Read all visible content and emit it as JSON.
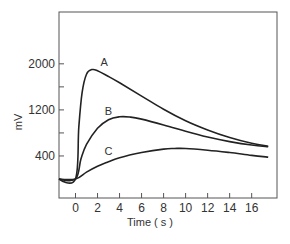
{
  "chart_data": {
    "type": "line",
    "title": "",
    "xlabel": "Time ( s )",
    "ylabel": "mV",
    "xlim": [
      -1.5,
      18.3
    ],
    "ylim": [
      -330,
      2900
    ],
    "grid": false,
    "legend": "inline curve labels",
    "x_ticks": [
      0,
      2,
      4,
      6,
      8,
      10,
      12,
      14,
      16
    ],
    "x_tick_labels": [
      "0",
      "2",
      "4",
      "6",
      "8",
      "10",
      "12",
      "14",
      "16"
    ],
    "y_ticks": [
      400,
      800,
      1200,
      1600,
      2000
    ],
    "y_tick_labels": [
      "400",
      "",
      "1200",
      "",
      "2000"
    ],
    "series": [
      {
        "name": "A",
        "x": [
          -1.5,
          0,
          0.3,
          0.6,
          1.0,
          1.5,
          2.0,
          3,
          4,
          6,
          8,
          10,
          12,
          14,
          16,
          17.5
        ],
        "values": [
          0,
          0,
          900,
          1500,
          1820,
          1900,
          1880,
          1780,
          1670,
          1440,
          1210,
          1010,
          850,
          720,
          620,
          570
        ]
      },
      {
        "name": "B",
        "x": [
          -1.5,
          0,
          0.5,
          1,
          2,
          3,
          4,
          5,
          6,
          8,
          10,
          12,
          14,
          16,
          17.5
        ],
        "values": [
          0,
          0,
          350,
          600,
          880,
          1030,
          1080,
          1075,
          1040,
          940,
          830,
          730,
          650,
          590,
          560
        ]
      },
      {
        "name": "C",
        "x": [
          -1.5,
          0,
          1,
          2,
          3,
          4,
          6,
          8,
          9,
          10,
          12,
          14,
          16,
          17.5
        ],
        "values": [
          0,
          0,
          120,
          220,
          300,
          370,
          460,
          520,
          530,
          530,
          500,
          460,
          410,
          380
        ]
      }
    ],
    "annotations": [
      {
        "text": "A",
        "x": 2.6,
        "y": 1960
      },
      {
        "text": "B",
        "x": 3.0,
        "y": 1120
      },
      {
        "text": "C",
        "x": 3.0,
        "y": 420
      }
    ]
  }
}
